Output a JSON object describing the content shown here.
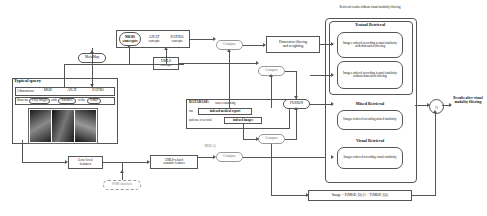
{
  "diagram": {
    "query_panel": {
      "heading": "Typical query",
      "dimension_label": "3 dimensions:",
      "dimensions": [
        "MOD",
        "ANAT",
        "PATHO"
      ],
      "sentence_parts": [
        "Show me",
        "x-ray images",
        "with",
        "fractures",
        "of the",
        "femur"
      ],
      "thumbnails_count": 3
    },
    "nodes": {
      "metamap": "MetaMap",
      "concepts_mod": "MOD concepts",
      "concepts_anat": "ANAT concepts",
      "concepts_patho": "PATHO concepts",
      "umls_concepts": "UMLS concepts",
      "compare_top": "Compare",
      "dimension_filtering": "Dimension filtering and weighting",
      "compare_mid": "Compare",
      "fusion_label": "FUSION",
      "compare_low": "Compare",
      "compare_bottom": "Compare",
      "low_level_features": "Low level features",
      "svm_classifiers": "SVM classifiers",
      "umls_semantic_features": "UMLS-related semantic features",
      "mod_q_label": "MOD_Q",
      "formula": "Image = P(MOD_Q) (1 + T(MOD_Q))"
    },
    "database": {
      "title": "DATABASE:",
      "desc_1": "cases containing",
      "desc_2": "one",
      "report": "indexed medical report",
      "desc_3": "and one or several",
      "images": "indexed images"
    },
    "results_panel": {
      "caption": "Retrieval results without visual modality filtering",
      "sections": [
        {
          "title": "Textual Retrieval",
          "items": [
            "Images ordered according textual similarity with dimension filtering",
            "Images ordered according textual similarity without dimension filtering"
          ]
        },
        {
          "title": "Mixed Retrieval",
          "items": [
            "Images ordered according mixed similarity"
          ]
        },
        {
          "title": "Visual Retrieval",
          "items": [
            "Images ordered according visual similarity"
          ]
        }
      ]
    },
    "output": {
      "fusion_symbol": "∩",
      "final_label": "Results after visual modality filtering"
    }
  }
}
